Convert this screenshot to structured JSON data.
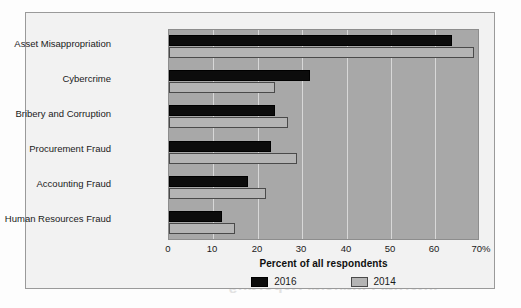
{
  "chart_data": {
    "type": "bar",
    "orientation": "horizontal",
    "title": "",
    "xlabel": "Percent of all respondents",
    "ylabel": "",
    "xlim": [
      0,
      70
    ],
    "xticks": [
      "0",
      "10",
      "20",
      "30",
      "40",
      "50",
      "60",
      "70%"
    ],
    "xtick_values": [
      0,
      10,
      20,
      30,
      40,
      50,
      60,
      70
    ],
    "grid": true,
    "legend_position": "bottom",
    "categories": [
      "Asset Misappropriation",
      "Cybercrime",
      "Bribery and Corruption",
      "Procurement Fraud",
      "Accounting Fraud",
      "Human Resources Fraud"
    ],
    "series": [
      {
        "name": "2016",
        "color": "#0c0c0c",
        "values": [
          64,
          32,
          24,
          23,
          18,
          12
        ]
      },
      {
        "name": "2014",
        "color": "#b4b4b4",
        "values": [
          69,
          24,
          27,
          29,
          22,
          15
        ]
      }
    ]
  },
  "colors": {
    "series_2016": "#0c0c0c",
    "series_2014": "#b4b4b4",
    "plot_background": "#a8a8a8",
    "figure_background": "#f2f2f2",
    "gridline": "#d8d8d8"
  },
  "bleed_text": "Internal Financial Reporting"
}
